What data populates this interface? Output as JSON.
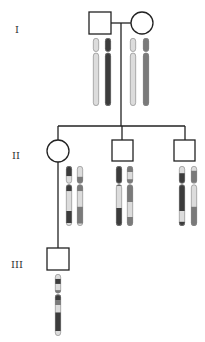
{
  "diagram": {
    "type": "pedigree-with-chromosomes",
    "colors": {
      "line": "#222222",
      "light": "#dcdcdc",
      "dark": "#3c3c3c",
      "mid": "#7a7a7a",
      "outline": "#888888"
    },
    "generations": [
      {
        "label": "I",
        "x": 15,
        "y": 24
      },
      {
        "label": "II",
        "x": 12,
        "y": 150
      },
      {
        "label": "III",
        "x": 11,
        "y": 259
      }
    ],
    "individuals": [
      {
        "id": "I-1",
        "sex": "male",
        "generation": "I",
        "shape": "square",
        "x": 89,
        "y": 12,
        "size": 22
      },
      {
        "id": "I-2",
        "sex": "female",
        "generation": "I",
        "shape": "circle",
        "cx": 142,
        "cy": 23,
        "r": 11
      },
      {
        "id": "II-1",
        "sex": "female",
        "generation": "II",
        "shape": "circle",
        "cx": 58,
        "cy": 151,
        "r": 11
      },
      {
        "id": "II-2",
        "sex": "male",
        "generation": "II",
        "shape": "square",
        "x": 112,
        "y": 140,
        "size": 21
      },
      {
        "id": "II-3",
        "sex": "male",
        "generation": "II",
        "shape": "square",
        "x": 174,
        "y": 140,
        "size": 21
      },
      {
        "id": "III-1",
        "sex": "male",
        "generation": "III",
        "shape": "square",
        "x": 47,
        "y": 248,
        "size": 22
      }
    ],
    "chromosomes": [
      {
        "owner": "I-1",
        "x": 93,
        "y": 38,
        "h": 68,
        "cen": 0.21,
        "bands": [
          {
            "from": 0,
            "to": 1,
            "color": "light"
          }
        ]
      },
      {
        "owner": "I-1",
        "x": 105,
        "y": 38,
        "h": 68,
        "cen": 0.21,
        "bands": [
          {
            "from": 0,
            "to": 1,
            "color": "dark"
          }
        ]
      },
      {
        "owner": "I-2",
        "x": 130,
        "y": 38,
        "h": 68,
        "cen": 0.21,
        "bands": [
          {
            "from": 0,
            "to": 1,
            "color": "light"
          }
        ]
      },
      {
        "owner": "I-2",
        "x": 143,
        "y": 38,
        "h": 68,
        "cen": 0.21,
        "bands": [
          {
            "from": 0,
            "to": 1,
            "color": "mid"
          }
        ]
      },
      {
        "owner": "II-1",
        "x": 66,
        "y": 166,
        "h": 60,
        "cen": 0.3,
        "bands": [
          {
            "from": 0,
            "to": 0.17,
            "color": "dark"
          },
          {
            "from": 0.17,
            "to": 0.3,
            "color": "light"
          },
          {
            "from": 0.3,
            "to": 0.42,
            "color": "dark"
          },
          {
            "from": 0.42,
            "to": 0.75,
            "color": "light"
          },
          {
            "from": 0.75,
            "to": 0.95,
            "color": "dark"
          },
          {
            "from": 0.95,
            "to": 1,
            "color": "light"
          }
        ]
      },
      {
        "owner": "II-1",
        "x": 77,
        "y": 166,
        "h": 60,
        "cen": 0.3,
        "bands": [
          {
            "from": 0,
            "to": 0.18,
            "color": "light"
          },
          {
            "from": 0.18,
            "to": 0.42,
            "color": "mid"
          },
          {
            "from": 0.42,
            "to": 0.68,
            "color": "light"
          },
          {
            "from": 0.68,
            "to": 0.96,
            "color": "mid"
          },
          {
            "from": 0.96,
            "to": 1,
            "color": "light"
          }
        ]
      },
      {
        "owner": "II-2",
        "x": 116,
        "y": 166,
        "h": 60,
        "cen": 0.3,
        "bands": [
          {
            "from": 0,
            "to": 0.33,
            "color": "dark"
          },
          {
            "from": 0.33,
            "to": 0.7,
            "color": "light"
          },
          {
            "from": 0.7,
            "to": 1,
            "color": "dark"
          }
        ]
      },
      {
        "owner": "II-2",
        "x": 127,
        "y": 166,
        "h": 60,
        "cen": 0.3,
        "bands": [
          {
            "from": 0,
            "to": 0.1,
            "color": "mid"
          },
          {
            "from": 0.1,
            "to": 0.22,
            "color": "light"
          },
          {
            "from": 0.22,
            "to": 0.6,
            "color": "mid"
          },
          {
            "from": 0.6,
            "to": 0.85,
            "color": "light"
          },
          {
            "from": 0.85,
            "to": 1,
            "color": "mid"
          }
        ]
      },
      {
        "owner": "II-3",
        "x": 179,
        "y": 166,
        "h": 60,
        "cen": 0.3,
        "bands": [
          {
            "from": 0,
            "to": 0.12,
            "color": "light"
          },
          {
            "from": 0.12,
            "to": 0.75,
            "color": "dark"
          },
          {
            "from": 0.75,
            "to": 0.93,
            "color": "light"
          },
          {
            "from": 0.93,
            "to": 1,
            "color": "dark"
          }
        ]
      },
      {
        "owner": "II-3",
        "x": 191,
        "y": 166,
        "h": 60,
        "cen": 0.3,
        "bands": [
          {
            "from": 0,
            "to": 0.08,
            "color": "light"
          },
          {
            "from": 0.08,
            "to": 0.28,
            "color": "mid"
          },
          {
            "from": 0.28,
            "to": 0.68,
            "color": "light"
          },
          {
            "from": 0.68,
            "to": 1,
            "color": "mid"
          }
        ]
      },
      {
        "owner": "III-1",
        "x": 55,
        "y": 274,
        "h": 62,
        "cen": 0.32,
        "bands": [
          {
            "from": 0,
            "to": 0.08,
            "color": "light"
          },
          {
            "from": 0.08,
            "to": 0.16,
            "color": "dark"
          },
          {
            "from": 0.16,
            "to": 0.26,
            "color": "light"
          },
          {
            "from": 0.26,
            "to": 0.34,
            "color": "mid"
          },
          {
            "from": 0.34,
            "to": 0.42,
            "color": "dark"
          },
          {
            "from": 0.42,
            "to": 0.5,
            "color": "mid"
          },
          {
            "from": 0.5,
            "to": 0.62,
            "color": "light"
          },
          {
            "from": 0.62,
            "to": 0.92,
            "color": "dark"
          },
          {
            "from": 0.92,
            "to": 1,
            "color": "light"
          }
        ]
      }
    ],
    "lines": [
      {
        "name": "marriage-line-I",
        "x1": 111,
        "y1": 23,
        "x2": 131,
        "y2": 23
      },
      {
        "name": "descent-line-I",
        "x1": 121,
        "y1": 23,
        "x2": 121,
        "y2": 126
      },
      {
        "name": "sibship-line-II",
        "x1": 58,
        "y1": 126,
        "x2": 185,
        "y2": 126
      },
      {
        "name": "drop-II-1",
        "x1": 58,
        "y1": 126,
        "x2": 58,
        "y2": 140
      },
      {
        "name": "drop-II-2",
        "x1": 122,
        "y1": 126,
        "x2": 122,
        "y2": 140
      },
      {
        "name": "drop-II-3",
        "x1": 185,
        "y1": 126,
        "x2": 185,
        "y2": 140
      },
      {
        "name": "descent-line-II-1",
        "x1": 58,
        "y1": 162,
        "x2": 58,
        "y2": 248
      }
    ]
  }
}
